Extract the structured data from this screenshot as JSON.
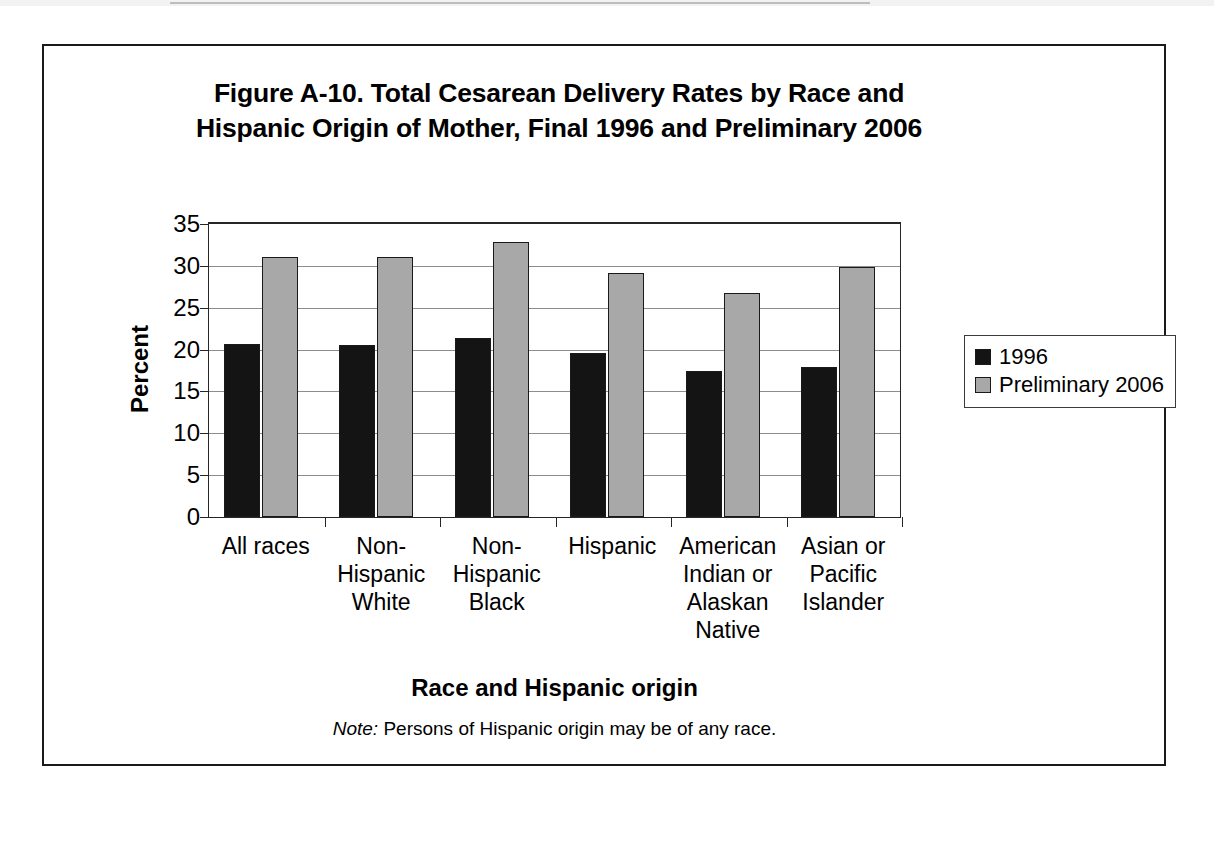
{
  "figure": {
    "title_line1": "Figure A-10. Total Cesarean Delivery Rates by Race and",
    "title_line2": "Hispanic Origin of Mother, Final 1996 and Preliminary 2006",
    "note_lead": "Note:",
    "note_text": "  Persons of Hispanic origin may be of any race."
  },
  "legend": {
    "position": "right",
    "items": [
      {
        "label": "1996",
        "color": "#141414"
      },
      {
        "label": "Preliminary 2006",
        "color": "#a8a8a8"
      }
    ]
  },
  "chart_data": {
    "type": "bar",
    "title": "Figure A-10. Total Cesarean Delivery Rates by Race and Hispanic Origin of Mother, Final 1996 and Preliminary 2006",
    "xlabel": "Race and Hispanic origin",
    "ylabel": "Percent",
    "ylim": [
      0,
      35
    ],
    "yticks": [
      0,
      5,
      10,
      15,
      20,
      25,
      30,
      35
    ],
    "ytick_labels": [
      "0",
      "5",
      "10",
      "15",
      "20",
      "25",
      "30",
      "35"
    ],
    "grid": true,
    "legend_position": "right",
    "categories": [
      "All races",
      "Non-\nHispanic\nWhite",
      "Non-\nHispanic\nBlack",
      "Hispanic",
      "American\nIndian or\nAlaskan\nNative",
      "Asian or\nPacific\nIslander"
    ],
    "series": [
      {
        "name": "1996",
        "color": "#141414",
        "values": [
          20.7,
          20.6,
          21.4,
          19.6,
          17.5,
          17.9
        ]
      },
      {
        "name": "Preliminary 2006",
        "color": "#a8a8a8",
        "values": [
          31.1,
          31.1,
          32.8,
          29.2,
          26.8,
          29.9
        ]
      }
    ],
    "note": "Note: Persons of Hispanic origin may be of any race."
  }
}
